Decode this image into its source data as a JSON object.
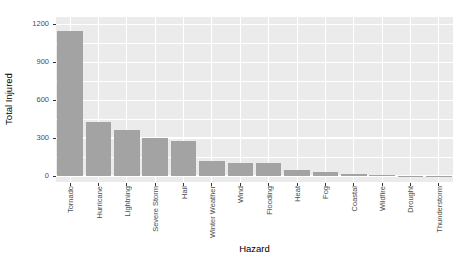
{
  "chart_data": {
    "type": "bar",
    "title": "",
    "xlabel": "Hazard",
    "ylabel": "Total Injured",
    "categories": [
      "Tornado",
      "Hurricane",
      "Lightning",
      "Severe Storm",
      "Hail",
      "Winter Weather",
      "Wind",
      "Flooding",
      "Heat",
      "Fog",
      "Coastal",
      "Wildfire",
      "Drought",
      "Thunderstorm"
    ],
    "values": [
      1150,
      425,
      360,
      300,
      280,
      120,
      100,
      100,
      45,
      30,
      15,
      6,
      2,
      1
    ],
    "ylim": [
      0,
      1200
    ],
    "yticks": [
      0,
      300,
      600,
      900,
      1200
    ],
    "minor_yticks": [
      150,
      450,
      750,
      1050
    ],
    "grid": true,
    "legend": "none",
    "bar_orientation": "vertical"
  },
  "colors": {
    "background": "#ffffff",
    "panel_bg": "#ebebeb",
    "grid_major": "#ffffff",
    "grid_minor": "#ffffff",
    "bar_fill": "#a3a3a3",
    "tick_text": "#4d4d4d",
    "axis_title": "#000000",
    "tick_mark": "#333333"
  }
}
